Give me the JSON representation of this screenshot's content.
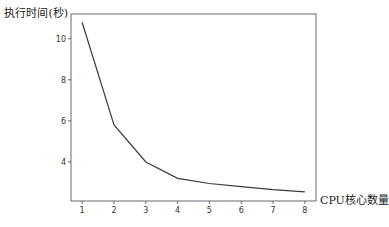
{
  "chart_data": {
    "type": "line",
    "title": "",
    "xlabel": "CPU核心数量",
    "ylabel": "执行时间(秒)",
    "x": [
      1,
      2,
      3,
      4,
      5,
      6,
      7,
      8
    ],
    "series": [
      {
        "name": "执行时间",
        "values": [
          10.8,
          5.8,
          4.0,
          3.2,
          2.95,
          2.8,
          2.65,
          2.55
        ],
        "color": "#3a3a3a"
      }
    ],
    "xticks": [
      1,
      2,
      3,
      4,
      5,
      6,
      7,
      8
    ],
    "yticks": [
      4,
      6,
      8,
      10
    ],
    "xlim": [
      0.65,
      8.35
    ],
    "ylim": [
      2.1,
      11.2
    ],
    "grid": false,
    "legend": "none"
  }
}
